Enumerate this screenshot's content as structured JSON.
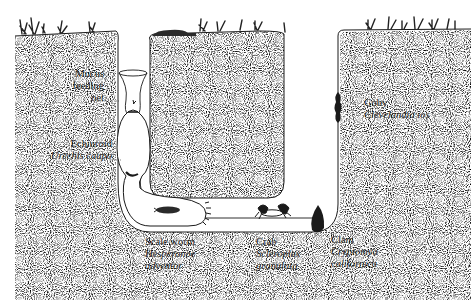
{
  "diagram": {
    "colors": {
      "sediment_stipple": "#8a8a8a",
      "burrow_fill": "#ffffff",
      "ink": "#1a1a1a",
      "background": "#ffffff"
    },
    "labels": [
      {
        "id": "mucus-net",
        "common": "Mucus",
        "line2": "feeding",
        "line3": "net"
      },
      {
        "id": "echiuroid",
        "common": "Echiuroid",
        "scientific": "Urechis caupo"
      },
      {
        "id": "scale-worm",
        "common": "Scale worm",
        "scientific_1": "Hesperonoe",
        "scientific_2": "adventor"
      },
      {
        "id": "crab",
        "common": "Crab",
        "scientific_1": "Scleroplax",
        "scientific_2": "granulata"
      },
      {
        "id": "clam",
        "common": "Clam",
        "scientific_1": "Cryptomya",
        "scientific_2": "californica"
      },
      {
        "id": "goby",
        "common": "Goby",
        "scientific": "Clevelandia ios"
      }
    ],
    "icons": [
      "grass-tuft-icon",
      "echiuroid-worm-icon",
      "scale-worm-icon",
      "crab-icon",
      "clam-icon",
      "goby-fish-icon",
      "mucus-net-icon",
      "rock-icon"
    ]
  }
}
